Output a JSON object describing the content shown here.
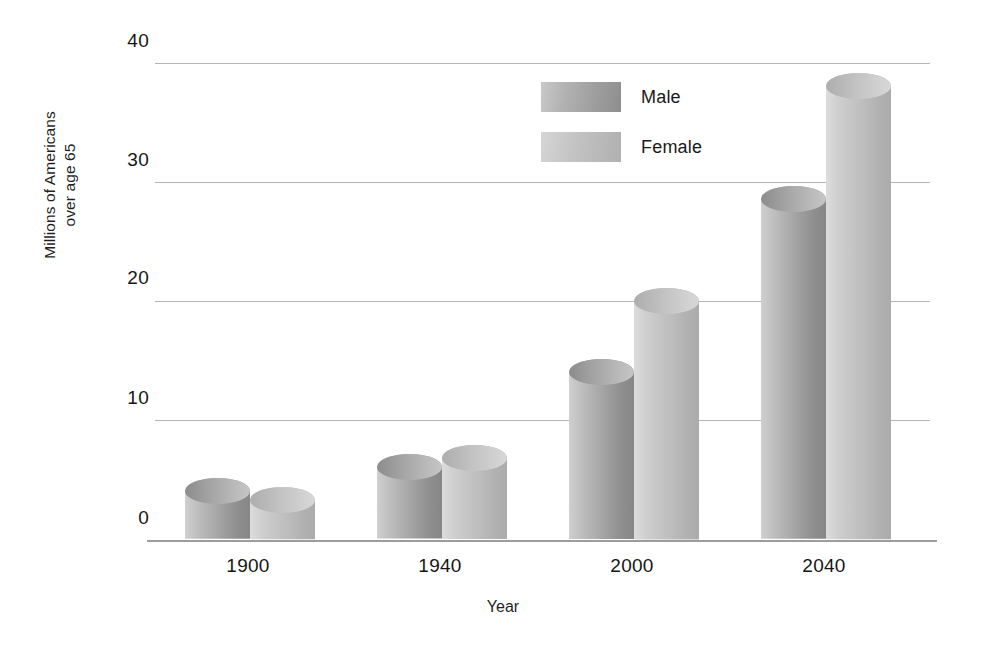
{
  "chart_data": {
    "type": "bar",
    "title": "",
    "xlabel": "Year",
    "ylabel": "Millions of Americans over age 65",
    "ylabel_line1": "Millions of Americans",
    "ylabel_line2": "over age 65",
    "categories": [
      "1900",
      "1940",
      "2000",
      "2040"
    ],
    "yticks": [
      "40",
      "30",
      "20",
      "10",
      "0"
    ],
    "ylim": [
      0,
      40
    ],
    "grid": true,
    "legend_position": "inside-top-center",
    "series": [
      {
        "name": "Male",
        "color": "#a3a3a3",
        "values": [
          4.0,
          6.0,
          14.0,
          28.5
        ]
      },
      {
        "name": "Female",
        "color": "#bdbdbd",
        "values": [
          3.3,
          6.8,
          20.0,
          38.0
        ]
      }
    ]
  },
  "legend": {
    "items": [
      {
        "label": "Male"
      },
      {
        "label": "Female"
      }
    ]
  },
  "axes": {
    "x_title": "Year",
    "y_title_line1": "Millions of Americans",
    "y_title_line2": "over age 65"
  }
}
